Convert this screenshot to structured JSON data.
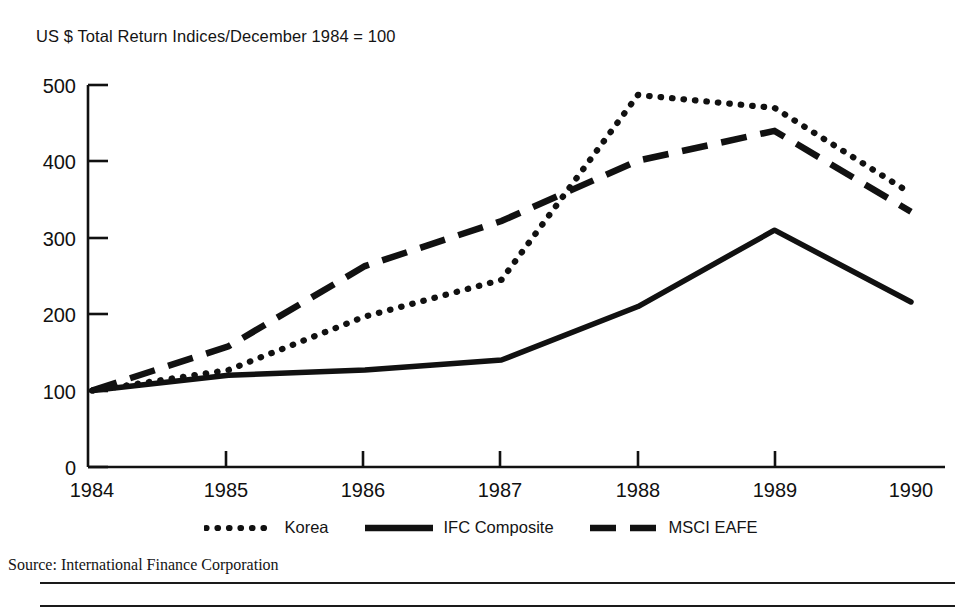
{
  "chart_data": {
    "type": "line",
    "title": "US $ Total Return Indices/December 1984 = 100",
    "xlabel": "",
    "ylabel": "",
    "categories": [
      "1984",
      "1985",
      "1986",
      "1987",
      "1988",
      "1989",
      "1990"
    ],
    "x": [
      1984,
      1985,
      1986,
      1987,
      1988,
      1989,
      1990
    ],
    "xlim": [
      1984,
      1990
    ],
    "ylim": [
      0,
      500
    ],
    "y_ticks": [
      "0",
      "100",
      "200",
      "300",
      "400",
      "500"
    ],
    "y_tick_values": [
      0,
      100,
      200,
      300,
      400,
      500
    ],
    "x_ticks": [
      "1984",
      "1985",
      "1986",
      "1987",
      "1988",
      "1989",
      "1990"
    ],
    "grid": false,
    "legend_position": "bottom",
    "series": [
      {
        "name": "Korea",
        "style": "dotted",
        "color": "#111111",
        "values": [
          100,
          127,
          197,
          245,
          487,
          470,
          358
        ]
      },
      {
        "name": "IFC Composite",
        "style": "solid",
        "color": "#111111",
        "values": [
          100,
          120,
          127,
          140,
          210,
          310,
          216
        ]
      },
      {
        "name": "MSCI EAFE",
        "style": "dashed",
        "color": "#111111",
        "values": [
          100,
          158,
          263,
          322,
          401,
          440,
          334
        ]
      }
    ]
  },
  "figure": {
    "title": "US $ Total Return Indices/December 1984 = 100",
    "source": "Source: International Finance Corporation",
    "legend": [
      {
        "label": "Korea",
        "style": "dotted"
      },
      {
        "label": "IFC Composite",
        "style": "solid"
      },
      {
        "label": "MSCI EAFE",
        "style": "dashed"
      }
    ],
    "colors": {
      "ink": "#111111",
      "background": "#ffffff"
    }
  }
}
